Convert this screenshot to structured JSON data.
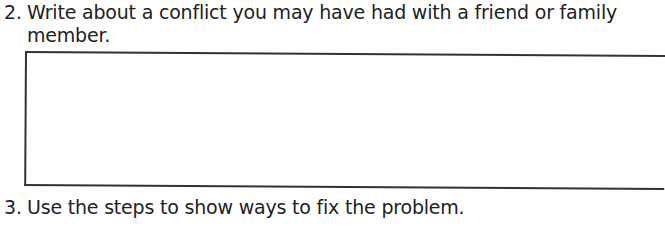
{
  "worksheet": {
    "questions": [
      {
        "number": "2.",
        "line1": "Write about a conflict you may have had with a friend or family",
        "line2": "member."
      },
      {
        "number": "3.",
        "line1": "Use the steps to show ways to fix the problem."
      }
    ],
    "answer_box": {
      "value": ""
    }
  }
}
